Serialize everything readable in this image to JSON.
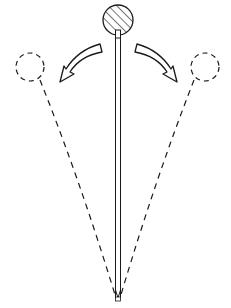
{
  "diagram": {
    "title": "",
    "type": "inverted-pendulum",
    "background": "#ffffff",
    "stroke_color": "#1a1a1a",
    "elements": {
      "mass": {
        "shape": "circle",
        "fill": "hatched",
        "cx": 118,
        "cy": 20,
        "r": 15
      },
      "rod": {
        "style": "double-line",
        "x": 118,
        "top": 36,
        "bottom": 298
      },
      "pivot": {
        "x": 118,
        "y": 300
      },
      "left_ghost": {
        "shape": "circle",
        "style": "dashed",
        "cx": 30,
        "cy": 67,
        "r": 14
      },
      "right_ghost": {
        "shape": "circle",
        "style": "dashed",
        "cx": 205,
        "cy": 67,
        "r": 14
      },
      "left_arrow": {
        "direction": "left",
        "style": "outline-curved"
      },
      "right_arrow": {
        "direction": "right",
        "style": "outline-curved"
      }
    },
    "labels": []
  }
}
